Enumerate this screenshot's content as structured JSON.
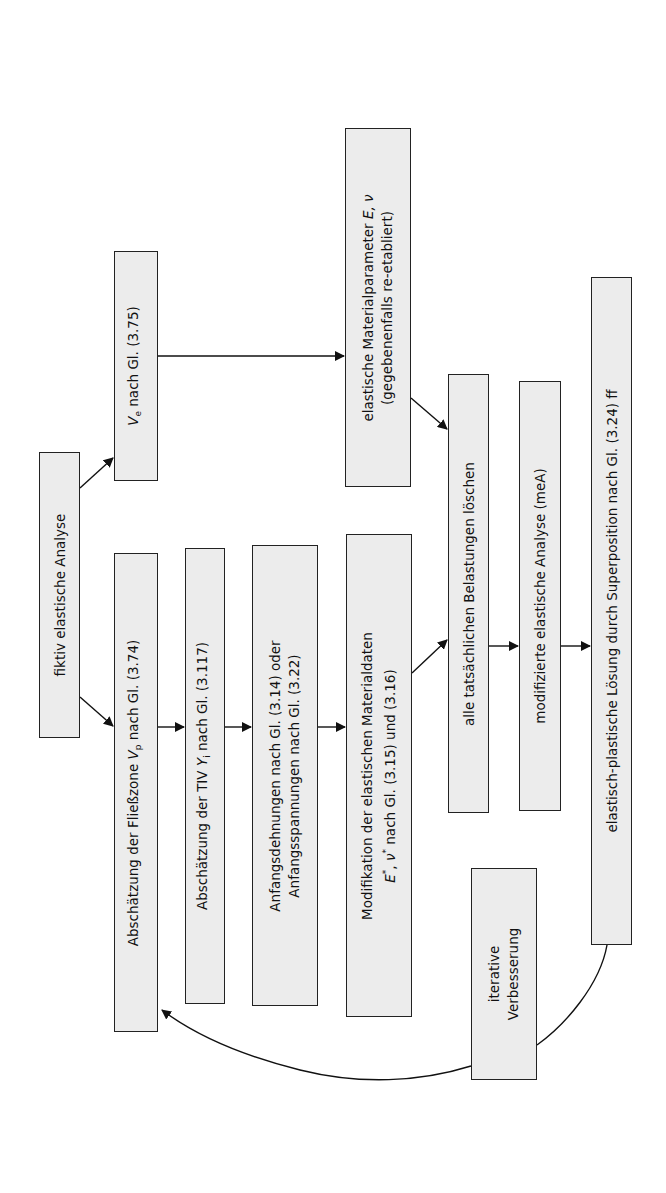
{
  "diagram": {
    "type": "flowchart",
    "orientation": "rotated-90-ccw",
    "colors": {
      "box_fill": "#ececec",
      "box_border": "#222222",
      "arrow": "#111111",
      "background": "#ffffff"
    },
    "nodes": {
      "start": {
        "text": "fiktiv elastische Analyse"
      },
      "vp": {
        "pre": "Abschätzung der Fließzone ",
        "sym": "V",
        "sub": "p",
        "post": " nach Gl. (3.74)"
      },
      "ve": {
        "sym": "V",
        "sub": "e",
        "post": " nach Gl. (3.75)"
      },
      "tiv": {
        "pre": "Abschätzung der TIV ",
        "sym": "Y",
        "sub": "i",
        "post": " nach Gl. (3.117)"
      },
      "anfang": {
        "line1": "Anfangsdehnungen nach Gl. (3.14) oder",
        "line2": "Anfangsspannungen nach Gl. (3.22)"
      },
      "modif": {
        "line1": "Modifikation der elastischen Materialdaten",
        "sym1": "E",
        "sup1": "*",
        "sep": ", ",
        "sym2": "ν",
        "sup2": "*",
        "line2_post": " nach Gl. (3.15) und (3.16)"
      },
      "material": {
        "line1_pre": "elastische Materialparameter ",
        "sym": "E, ν",
        "line2": "(gegebenenfalls re-etabliert)"
      },
      "loeschen": {
        "text": "alle tatsächlichen Belastungen löschen"
      },
      "mea": {
        "text": "modifizierte elastische Analyse (meA)"
      },
      "superpos": {
        "text": "elastisch-plastische Lösung durch Superposition nach Gl. (3.24) ff"
      },
      "iterativ": {
        "line1": "iterative",
        "line2": "Verbesserung"
      }
    },
    "edges": [
      [
        "start",
        "vp"
      ],
      [
        "start",
        "ve"
      ],
      [
        "vp",
        "tiv"
      ],
      [
        "tiv",
        "anfang"
      ],
      [
        "anfang",
        "modif"
      ],
      [
        "ve",
        "material"
      ],
      [
        "modif",
        "loeschen"
      ],
      [
        "material",
        "loeschen"
      ],
      [
        "loeschen",
        "mea"
      ],
      [
        "mea",
        "superpos"
      ],
      [
        "superpos",
        "iterativ"
      ],
      [
        "iterativ",
        "vp"
      ]
    ]
  }
}
